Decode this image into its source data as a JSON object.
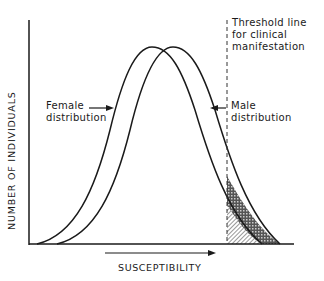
{
  "diagram": {
    "type": "overlapping normal distributions with threshold",
    "y_axis_label": "NUMBER OF INDIVIDUALS",
    "x_axis_label": "SUSCEPTIBILITY",
    "threshold_label": "Threshold line\nfor clinical\nmanifestation",
    "female_label": "Female\ndistribution",
    "male_label": "Male\ndistribution",
    "curves": [
      {
        "name": "Female distribution",
        "peak_position": "left",
        "stroke": "#1a1a1a"
      },
      {
        "name": "Male distribution",
        "peak_position": "right",
        "stroke": "#1a1a1a"
      }
    ],
    "shaded_regions": [
      {
        "name": "female-above-threshold",
        "pattern": "diagonal-hatch"
      },
      {
        "name": "male-above-threshold",
        "pattern": "cross-hatch"
      }
    ],
    "colors": {
      "ink": "#1a1a1a",
      "background": "#ffffff"
    }
  }
}
